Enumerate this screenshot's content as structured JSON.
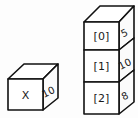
{
  "diagram": {
    "background_color": "#fdfdfd",
    "stroke_color": "#111111",
    "face_color": "#ffffff",
    "text_color": "#1a1a1a",
    "single_box": {
      "name": "variable-box",
      "front_label": "X",
      "side_label": "10"
    },
    "stack": {
      "name": "array-box-stack",
      "boxes": [
        {
          "index_label": "[0]",
          "value_label": "5"
        },
        {
          "index_label": "[1]",
          "value_label": "10"
        },
        {
          "index_label": "[2]",
          "value_label": "8"
        }
      ]
    }
  }
}
